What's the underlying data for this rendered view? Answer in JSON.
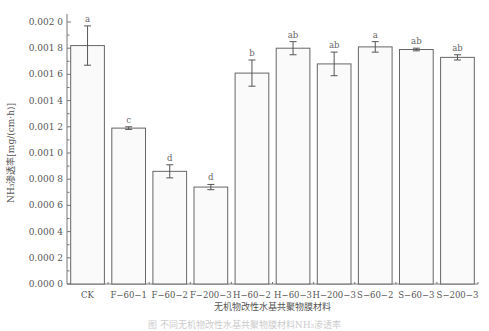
{
  "chart_data": {
    "type": "bar",
    "title": "",
    "xlabel": "无机物改性水基共聚物膜材料",
    "ylabel": "NH₃渗透率[mg/(cm·h)]",
    "ylim": [
      0,
      0.002
    ],
    "yticks": [
      "0.000 0",
      "0.000 2",
      "0.000 4",
      "0.000 6",
      "0.000 8",
      "0.001 0",
      "0.001 2",
      "0.001 4",
      "0.001 6",
      "0.001 8",
      "0.002 0"
    ],
    "grid": false,
    "legend": null,
    "categories": [
      "CK",
      "F−60−1",
      "F−60−2",
      "F−200−3",
      "H−60−2",
      "H−60−3",
      "H−200−3",
      "S−60−2",
      "S−60−3",
      "S−200−3"
    ],
    "values": [
      0.00182,
      0.00119,
      0.00086,
      0.00074,
      0.00161,
      0.0018,
      0.00168,
      0.00181,
      0.00179,
      0.00173
    ],
    "errors": [
      0.00015,
      1e-05,
      5e-05,
      2e-05,
      0.0001,
      5e-05,
      9e-05,
      4e-05,
      1e-05,
      2e-05
    ],
    "significance": [
      "a",
      "c",
      "d",
      "d",
      "b",
      "ab",
      "ab",
      "a",
      "ab",
      "ab"
    ]
  },
  "caption": "图  不同无机物改性水基共聚物膜材料NH₃渗透率"
}
